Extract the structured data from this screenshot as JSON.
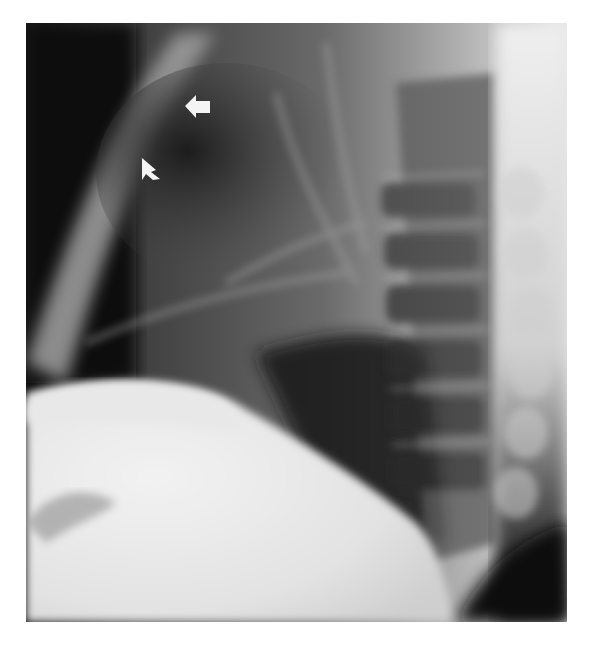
{
  "figure": {
    "description": "Lateral chest radiograph with two white arrows indicating a finding in the anterior upper chest",
    "view": "lateral chest x-ray",
    "frame": {
      "x": 26,
      "y": 23,
      "width": 541,
      "height": 599
    },
    "background_color": "#ffffff",
    "annotations": [
      {
        "type": "arrow",
        "direction": "left",
        "x": 185,
        "y": 95,
        "width": 25,
        "height": 22,
        "color": "#f4f4f4"
      },
      {
        "type": "arrow",
        "direction": "up-left",
        "x": 140,
        "y": 158,
        "width": 20,
        "height": 22,
        "color": "#f4f4f4"
      }
    ],
    "tones": {
      "dark": "#0d0d0d",
      "lung": "#3a3a3a",
      "mid": "#7a7a7a",
      "bone": "#c8c8c8",
      "bright": "#ececec"
    }
  }
}
